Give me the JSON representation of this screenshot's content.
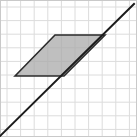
{
  "figure": {
    "width": 137,
    "height": 137,
    "background_color": "#ffffff",
    "border": {
      "color": "#c9c9c9",
      "width": 1
    }
  },
  "grid": {
    "line_color": "#dcdcdc",
    "line_width": 1,
    "cell_size": 13.6,
    "origin_x": 7,
    "origin_y": 7,
    "columns": 9,
    "rows": 9,
    "x_positions": [
      7,
      20.6,
      34.2,
      47.8,
      61.4,
      75,
      88.6,
      102.2,
      115.8,
      129.4
    ],
    "y_positions": [
      7,
      20.6,
      34.2,
      47.8,
      61.4,
      75,
      88.6,
      102.2,
      115.8,
      129.4
    ]
  },
  "parallelogram": {
    "label": "shaded parallelogram",
    "fill_color": "#a9a9a9",
    "fill_opacity": 0.75,
    "stroke_color": "#2b2b2b",
    "stroke_width": 1.6,
    "points": "15,76 55,35 105,35 64,76",
    "vertices": [
      {
        "name": "left",
        "x": 15,
        "y": 76
      },
      {
        "name": "top-left",
        "x": 55,
        "y": 35
      },
      {
        "name": "top-right",
        "x": 105,
        "y": 35
      },
      {
        "name": "bottom-right",
        "x": 64,
        "y": 76
      }
    ],
    "base_length_cells": 3.6,
    "height_cells": 3.0,
    "slant_direction": "up-right"
  },
  "diagonal_line": {
    "label": "diagonal line through parallelogram",
    "stroke_color": "#1c1c1c",
    "stroke_width": 2.0,
    "x1": -2,
    "y1": 138,
    "x2": 134,
    "y2": 4,
    "slope": -1,
    "description": "line rising from lower-left to upper-right"
  },
  "chart_data": {
    "type": "scatter",
    "xlabel": "",
    "ylabel": "",
    "xlim": [
      0,
      9
    ],
    "ylim": [
      0,
      9
    ],
    "grid": true,
    "legend": "none",
    "series": [
      {
        "name": "parallelogram",
        "kind": "polygon",
        "closed": true,
        "fill": "#a9a9a9",
        "stroke": "#2b2b2b",
        "x": [
          0.6,
          3.5,
          7.2,
          4.2
        ],
        "y": [
          3.9,
          6.9,
          6.9,
          3.9
        ]
      },
      {
        "name": "diagonal",
        "kind": "line",
        "stroke": "#1c1c1c",
        "x": [
          -0.1,
          9.6
        ],
        "y": [
          -0.1,
          9.7
        ]
      }
    ],
    "annotations": []
  }
}
